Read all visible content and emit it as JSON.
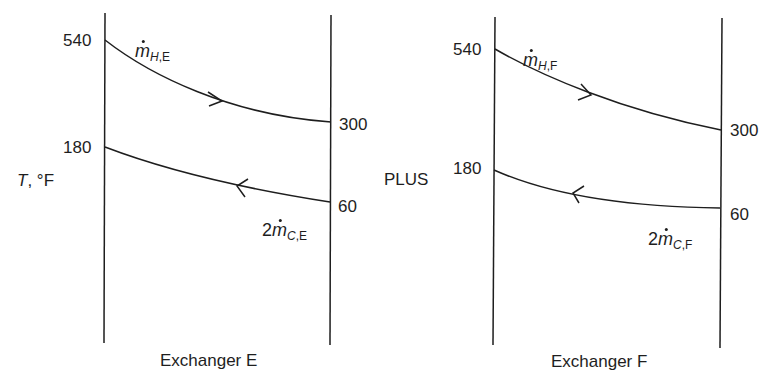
{
  "y_axis_label": {
    "symbol": "T",
    "unit": ", °F"
  },
  "separator": "PLUS",
  "exchangers": [
    {
      "name": "Exchanger E",
      "hot_stream": {
        "label_prefix": "",
        "mass_symbol": "m",
        "sub_stream": "H",
        "sub_id": ",E",
        "t_in": "540",
        "t_out": "300",
        "direction": "left-to-right"
      },
      "cold_stream": {
        "label_prefix": "2",
        "mass_symbol": "m",
        "sub_stream": "C",
        "sub_id": ",E",
        "t_in": "60",
        "t_out": "180",
        "direction": "right-to-left"
      }
    },
    {
      "name": "Exchanger F",
      "hot_stream": {
        "label_prefix": "",
        "mass_symbol": "m",
        "sub_stream": "H",
        "sub_id": ",F",
        "t_in": "540",
        "t_out": "300",
        "direction": "left-to-right"
      },
      "cold_stream": {
        "label_prefix": "2",
        "mass_symbol": "m",
        "sub_stream": "C",
        "sub_id": ",F",
        "t_in": "60",
        "t_out": "180",
        "direction": "right-to-left"
      }
    }
  ],
  "colors": {
    "line": "#1e1e1e",
    "background": "#ffffff"
  }
}
